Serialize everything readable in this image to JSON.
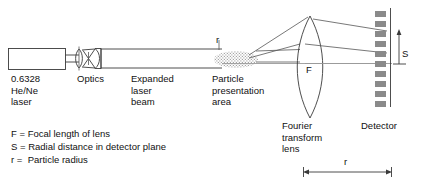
{
  "diagram": {
    "title_labels": {
      "laser": "0.6328\nHe/Ne\nlaser",
      "optics": "Optics",
      "expanded_beam": "Expanded\nlaser\nbeam",
      "particle_area": "Particle\npresentation\narea",
      "fourier_lens": "Fourier\ntransform\nlens",
      "detector": "Detector"
    },
    "inline_symbols": {
      "focal_length": "F",
      "radial_distance": "S",
      "particle_radius": "r",
      "dimension_r": "r"
    },
    "legend": [
      "F = Focal length of lens",
      "S = Radial distance in detector plane",
      "r =  Particle radius"
    ],
    "colors": {
      "line": "#3a3a3a",
      "detector_segment": "#8a8a8a",
      "text": "#111111",
      "background": "#ffffff"
    }
  }
}
